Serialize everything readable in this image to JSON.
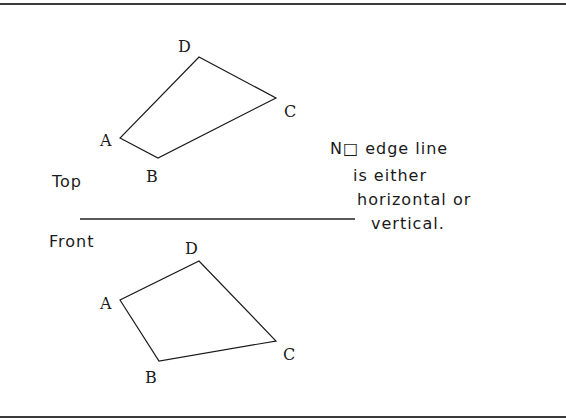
{
  "views": {
    "top": {
      "label": "Top",
      "vertices": {
        "A": {
          "label": "A",
          "x": 120,
          "y": 138
        },
        "B": {
          "label": "B",
          "x": 158,
          "y": 158
        },
        "C": {
          "label": "C",
          "x": 276,
          "y": 98
        },
        "D": {
          "label": "D",
          "x": 199,
          "y": 57
        }
      }
    },
    "front": {
      "label": "Front",
      "vertices": {
        "A": {
          "label": "A",
          "x": 120,
          "y": 300
        },
        "B": {
          "label": "B",
          "x": 159,
          "y": 361
        },
        "C": {
          "label": "C",
          "x": 276,
          "y": 341
        },
        "D": {
          "label": "D",
          "x": 199,
          "y": 261
        }
      }
    }
  },
  "note": {
    "lines": [
      "N□ edge line",
      "is either",
      "horizontal or",
      "vertical."
    ]
  },
  "colors": {
    "line": "#1a1a1a",
    "background": "#ffffff",
    "frame": "#3a3a3a"
  }
}
